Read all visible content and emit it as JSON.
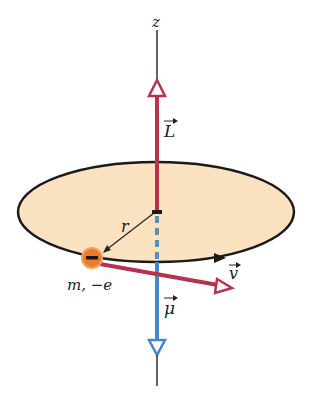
{
  "diagram": {
    "axis_label": "z",
    "angular_momentum_label": "L",
    "magnetic_moment_label": "μ",
    "radius_label": "r",
    "velocity_label": "v",
    "particle_label": "m, −e",
    "particle_sign": "−",
    "colors": {
      "disk_fill": "#fbe3c2",
      "outline": "#1a1a1a",
      "L_vector": "#b8324f",
      "mu_vector": "#4a86c5",
      "v_vector": "#b8324f",
      "electron": "#ee7a2a"
    }
  }
}
